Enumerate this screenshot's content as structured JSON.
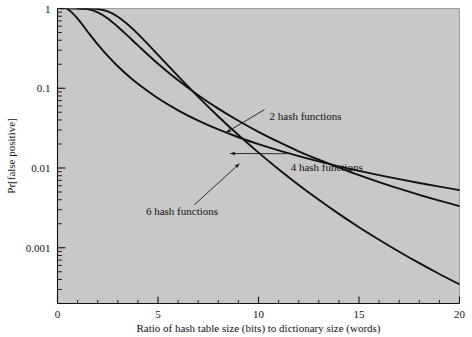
{
  "chart_data": {
    "type": "line",
    "title": "",
    "subtitle": "",
    "xlabel": "Ratio of hash table size (bits) to dictionary size (words)",
    "ylabel": "Pr[false positive]",
    "xlim": [
      0,
      20
    ],
    "ylim": [
      0.0002,
      1
    ],
    "yscale": "log",
    "xscale": "linear",
    "grid": false,
    "legend_position": "inline-annotations",
    "plot_background": "#c8c8c8",
    "line_color": "#111111",
    "xticks": [
      0,
      5,
      10,
      15,
      20
    ],
    "xtick_labels": [
      "0",
      "5",
      "10",
      "15",
      "20"
    ],
    "yticks": [
      1,
      0.1,
      0.01,
      0.001
    ],
    "ytick_labels": [
      "1",
      "0.1",
      "0.01",
      "0.001"
    ],
    "series": [
      {
        "name": "2 hash functions",
        "k": 2,
        "formula": "(1 - exp(-k/m))^k",
        "x": [
          0.2,
          0.5,
          1,
          1.5,
          2,
          2.5,
          3,
          3.5,
          4,
          5,
          6,
          7,
          8,
          9,
          10,
          11,
          12,
          13,
          14,
          15,
          16,
          17,
          18,
          19,
          20
        ],
        "values": [
          0.99996,
          0.9866,
          0.7476,
          0.5116,
          0.3543,
          0.2541,
          0.1888,
          0.1446,
          0.1137,
          0.0748,
          0.0528,
          0.0393,
          0.0304,
          0.0243,
          0.0199,
          0.0166,
          0.0141,
          0.0121,
          0.0105,
          0.00922,
          0.00814,
          0.00724,
          0.00648,
          0.00584,
          0.00528
        ]
      },
      {
        "name": "4 hash functions",
        "k": 4,
        "formula": "(1 - exp(-k/m))^k",
        "x": [
          0.5,
          1,
          1.5,
          2,
          2.5,
          3,
          3.5,
          4,
          5,
          6,
          7,
          8,
          9,
          10,
          11,
          12,
          13,
          14,
          15,
          16,
          17,
          18,
          19,
          20
        ],
        "values": [
          1.0,
          0.9996,
          0.9818,
          0.8966,
          0.7513,
          0.5916,
          0.4534,
          0.3445,
          0.203,
          0.1256,
          0.0817,
          0.0555,
          0.0391,
          0.0284,
          0.0212,
          0.0162,
          0.0127,
          0.0101,
          0.00813,
          0.00665,
          0.00551,
          0.00461,
          0.0039,
          0.00333
        ]
      },
      {
        "name": "6 hash functions",
        "k": 6,
        "formula": "(1 - exp(-k/m))^k",
        "x": [
          1,
          1.5,
          2,
          2.5,
          3,
          3.5,
          4,
          5,
          6,
          7,
          8,
          9,
          10,
          11,
          12,
          13,
          14,
          15,
          16,
          17,
          18,
          19,
          20
        ],
        "values": [
          1.0,
          0.9995,
          0.9862,
          0.9194,
          0.7896,
          0.6301,
          0.4798,
          0.2624,
          0.1416,
          0.0781,
          0.0443,
          0.0259,
          0.0156,
          0.00966,
          0.00614,
          0.004,
          0.00266,
          0.00181,
          0.00126,
          0.000891,
          0.000641,
          0.000469,
          0.000348
        ]
      }
    ],
    "annotations": [
      {
        "text": "2 hash functions",
        "label_x": 10.55,
        "label_y": 0.0455,
        "arrow_from_x": 10.3,
        "arrow_from_y": 0.054,
        "arrow_to_x": 8.4,
        "arrow_to_y": 0.028
      },
      {
        "text": "4 hash functions",
        "label_x": 11.6,
        "label_y": 0.0102,
        "arrow_from_x": 11.4,
        "arrow_from_y": 0.0151,
        "arrow_to_x": 8.6,
        "arrow_to_y": 0.0152
      },
      {
        "text": "6 hash functions",
        "label_x": 4.4,
        "label_y": 0.0029,
        "arrow_from_x": 6.8,
        "arrow_from_y": 0.00345,
        "arrow_to_x": 9.05,
        "arrow_to_y": 0.0113
      }
    ]
  }
}
